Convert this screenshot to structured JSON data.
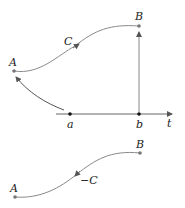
{
  "top_diagram": {
    "point_A": "A",
    "point_B": "B",
    "curve_label": "C",
    "axis_points": [
      "a",
      "b"
    ],
    "axis_label": "t"
  },
  "bottom_diagram": {
    "point_A": "A",
    "point_B": "B",
    "curve_label": "−C"
  },
  "colors": {
    "curve": "#8a8a8a",
    "point": "#777777",
    "axis_point": "#111111",
    "text": "#222222"
  }
}
